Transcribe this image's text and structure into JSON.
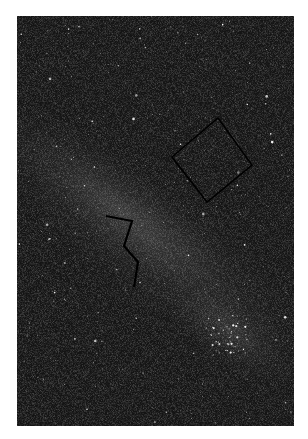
{
  "image": {
    "subject": "Milky Way star field night sky photograph",
    "alt": "Dense star field with a diagonal Milky Way band, annotated with a black diamond outline and a black zigzag line"
  },
  "annotations": {
    "diamond": {
      "label": "diamond-outline",
      "color": "#000000",
      "points": [
        [
          218,
          118
        ],
        [
          252,
          165
        ],
        [
          207,
          202
        ],
        [
          172,
          157
        ]
      ]
    },
    "zigzag": {
      "label": "zigzag-line",
      "color": "#000000",
      "points": [
        [
          106,
          216
        ],
        [
          132,
          221
        ],
        [
          124,
          246
        ],
        [
          138,
          262
        ],
        [
          134,
          287
        ]
      ]
    }
  },
  "colors": {
    "sky_dark": "#141414",
    "milky_way_glow": "#3a3a3a",
    "star": "#ffffff",
    "border": "#ffffff"
  }
}
